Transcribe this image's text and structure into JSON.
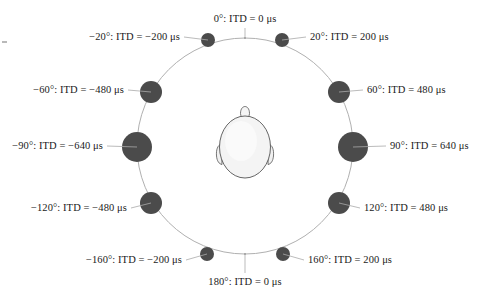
{
  "figure": {
    "title": "",
    "head_icon": "head-top-view-icon",
    "ring_color": "#b0b0b0",
    "speaker_color": "#4b4b4b",
    "head_fill": "#f2f2f2",
    "head_outline": "#555555",
    "background": "#ffffff"
  },
  "chart_data": {
    "type": "scatter",
    "title": "",
    "xlabel": "",
    "ylabel": "",
    "units": "μs",
    "angle_unit": "°",
    "legend": [],
    "grid": false,
    "categories": [
      "0°",
      "20°",
      "60°",
      "90°",
      "120°",
      "160°",
      "180°",
      "-160°",
      "-120°",
      "-90°",
      "-60°",
      "-20°"
    ],
    "values": [
      0,
      200,
      480,
      640,
      480,
      200,
      0,
      -200,
      -480,
      -640,
      -480,
      -200
    ],
    "points": [
      {
        "angle": 0,
        "itd": 0,
        "label": "0°: ITD = 0 μs",
        "marker_radius": 0,
        "label_anchor": "center",
        "lx": 245,
        "ly": 14,
        "cx": 245,
        "cy": 38
      },
      {
        "angle": 20,
        "itd": 200,
        "label": "20°: ITD = 200 μs",
        "marker_radius": 7,
        "label_anchor": "right",
        "lx": 310,
        "ly": 32,
        "cx": 282,
        "cy": 40
      },
      {
        "angle": 60,
        "itd": 480,
        "label": "60°: ITD = 480 μs",
        "marker_radius": 11,
        "label_anchor": "right",
        "lx": 367,
        "ly": 85,
        "cx": 339,
        "cy": 92
      },
      {
        "angle": 90,
        "itd": 640,
        "label": "90°: ITD = 640 μs",
        "marker_radius": 15,
        "label_anchor": "right",
        "lx": 390,
        "ly": 141,
        "cx": 353,
        "cy": 147
      },
      {
        "angle": 120,
        "itd": 480,
        "label": "120°: ITD = 480 μs",
        "marker_radius": 11,
        "label_anchor": "right",
        "lx": 364,
        "ly": 203,
        "cx": 339,
        "cy": 203
      },
      {
        "angle": 160,
        "itd": 200,
        "label": "160°: ITD = 200 μs",
        "marker_radius": 7,
        "label_anchor": "right",
        "lx": 308,
        "ly": 255,
        "cx": 283,
        "cy": 254
      },
      {
        "angle": 180,
        "itd": 0,
        "label": "180°: ITD = 0 μs",
        "marker_radius": 0,
        "label_anchor": "center",
        "lx": 245,
        "ly": 277,
        "cx": 245,
        "cy": 255
      },
      {
        "angle": -160,
        "itd": -200,
        "label": "−160°: ITD = −200 μs",
        "marker_radius": 7,
        "label_anchor": "left",
        "lx": 182,
        "ly": 255,
        "cx": 207,
        "cy": 254
      },
      {
        "angle": -120,
        "itd": -480,
        "label": "−120°: ITD = −480 μs",
        "marker_radius": 11,
        "label_anchor": "left",
        "lx": 127,
        "ly": 203,
        "cx": 151,
        "cy": 203
      },
      {
        "angle": -90,
        "itd": -640,
        "label": "−90°: ITD = −640 μs",
        "marker_radius": 15,
        "label_anchor": "left",
        "lx": 103,
        "ly": 141,
        "cx": 137,
        "cy": 147
      },
      {
        "angle": -60,
        "itd": -480,
        "label": "−60°: ITD = −480 μs",
        "marker_radius": 11,
        "label_anchor": "left",
        "lx": 124,
        "ly": 85,
        "cx": 151,
        "cy": 92
      },
      {
        "angle": -20,
        "itd": -200,
        "label": "−20°: ITD = −200 μs",
        "marker_radius": 7,
        "label_anchor": "left",
        "lx": 180,
        "ly": 32,
        "cx": 208,
        "cy": 40
      }
    ],
    "ring": {
      "cx": 245,
      "cy": 146,
      "r": 108
    }
  },
  "labels": {
    "deg_0": "0°: ITD = 0 μs",
    "deg_20": "20°: ITD = 200 μs",
    "deg_60": "60°: ITD = 480 μs",
    "deg_90": "90°: ITD = 640 μs",
    "deg_120": "120°: ITD = 480 μs",
    "deg_160": "160°: ITD = 200 μs",
    "deg_180": "180°: ITD = 0 μs",
    "deg_neg160": "−160°: ITD = −200 μs",
    "deg_neg120": "−120°: ITD = −480 μs",
    "deg_neg90": "−90°: ITD = −640 μs",
    "deg_neg60": "−60°: ITD = −480 μs",
    "deg_neg20": "−20°: ITD = −200 μs"
  }
}
